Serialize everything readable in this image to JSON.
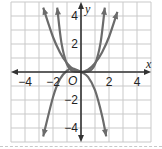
{
  "chart_data": {
    "type": "line",
    "title": "",
    "xlabel": "x",
    "ylabel": "y",
    "origin_label": "O",
    "xlim": [
      -5,
      5
    ],
    "ylim": [
      -5,
      5
    ],
    "grid": true,
    "x_ticks": [
      -4,
      -2,
      2,
      4
    ],
    "y_ticks": [
      -4,
      -2,
      2,
      4
    ],
    "x_tick_labels": [
      "−4",
      "−2",
      "2",
      "4"
    ],
    "y_tick_labels": [
      "−4",
      "−2",
      "2",
      "4"
    ],
    "series": [
      {
        "name": "steep-even-curve",
        "x": [
          -1.7,
          -1.4,
          -1.0,
          -0.6,
          0,
          0.6,
          1.0,
          1.4,
          1.7
        ],
        "values": [
          4.6,
          2.1,
          0.55,
          0.07,
          0,
          0.07,
          0.55,
          2.1,
          4.6
        ]
      },
      {
        "name": "wide-parabola",
        "x": [
          -2.7,
          -2.0,
          -1.5,
          -1.0,
          -0.5,
          0,
          0.5,
          1.0,
          1.5,
          2.0,
          2.6
        ],
        "values": [
          4.6,
          2.5,
          1.4,
          0.63,
          0.16,
          0,
          0.16,
          0.63,
          1.4,
          2.5,
          4.3
        ]
      },
      {
        "name": "cubic-decreasing",
        "x": [
          -2.7,
          -2.0,
          -1.5,
          -1.0,
          -0.6,
          -0.3,
          0,
          0.5,
          1.0,
          1.5,
          1.8
        ],
        "values": [
          -4.6,
          -1.8,
          -0.5,
          0.1,
          0.25,
          0.15,
          0,
          -0.35,
          -1.3,
          -3.1,
          -4.6
        ]
      }
    ],
    "colors": {
      "curve": "#6b6b6b",
      "axis": "#333333",
      "grid": "#c9c9c9",
      "text": "#222222"
    }
  }
}
